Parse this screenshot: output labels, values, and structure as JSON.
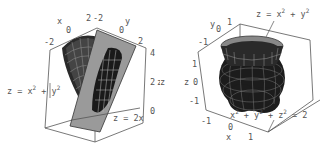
{
  "figures": [
    {
      "id": "left",
      "axes": {
        "x_label": "x",
        "x_ticks": [
          "-2",
          "0",
          "2"
        ],
        "y_label": "y",
        "y_ticks": [
          "-2",
          "0",
          "2"
        ],
        "z_label": "z",
        "z_ticks": [
          "0",
          "2",
          "4"
        ]
      },
      "annotations": [
        {
          "text": "z = x",
          "sup": "2",
          "text2": " + y",
          "sup2": "2"
        },
        {
          "text": "z = 2x"
        }
      ]
    },
    {
      "id": "right",
      "axes": {
        "x_label": "x",
        "x_ticks": [
          "-1",
          "0",
          "1"
        ],
        "y_label": "y",
        "y_ticks": [
          "-1",
          "0",
          "1"
        ],
        "z_label": "z",
        "z_ticks": [
          "-1",
          "0",
          "1"
        ],
        "outer_z_label": "z"
      },
      "annotations": [
        {
          "text": "z = x",
          "sup": "2",
          "text2": " + y",
          "sup2": "2"
        },
        {
          "text": "x",
          "sup": "2",
          "text2": " + y",
          "sup2": "2",
          "text3": " + z",
          "sup3": "2",
          "text4": " = 2"
        }
      ]
    }
  ],
  "colors": {
    "surface_dark": "#1a1a1a",
    "surface_mid": "#555555",
    "plane_gray": "#9a9a9a",
    "axis_text": "#555555",
    "box_line": "#555555"
  }
}
